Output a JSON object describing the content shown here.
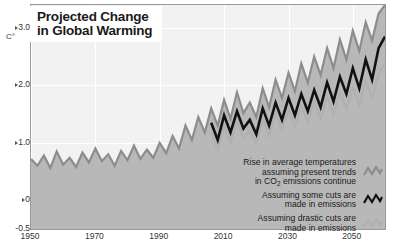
{
  "title": {
    "line1": "Projected Change",
    "line2": "in Global Warming"
  },
  "axes": {
    "y_unit": "C°",
    "y_ticks": [
      "3.0",
      "2.0",
      "1.0",
      "0",
      "-0.5"
    ],
    "y_tick_values": [
      3.0,
      2.0,
      1.0,
      0,
      -0.5
    ],
    "x_ticks": [
      "1950",
      "1970",
      "1990",
      "2010",
      "2030",
      "2050"
    ],
    "x_tick_values": [
      1950,
      1970,
      1990,
      2010,
      2030,
      2050
    ]
  },
  "legend": {
    "items": [
      {
        "line1": "Rise in average temperatures",
        "line2": "assuming present trends",
        "line3_pre": "in CO",
        "line3_sub": "2",
        "line3_post": " emissions continue",
        "glyph": "zigzag-line-icon",
        "color": "#8c8c8c"
      },
      {
        "line1": "Assuming some cuts are",
        "line2": "made in emissions",
        "glyph": "zigzag-line-icon",
        "color": "#111111"
      },
      {
        "line1": "Assuming drastic cuts are",
        "line2": "made in emissions",
        "glyph": "zigzag-line-icon",
        "color": "#b0b0b0"
      }
    ]
  },
  "colors": {
    "plot_background": "#f2f2f2",
    "area_fill": "#b8b8b8",
    "grid": "#ffffff",
    "border": "#9a9a9a",
    "high_scenario": "#8c8c8c",
    "mid_scenario": "#111111",
    "low_scenario": "#b0b0b0",
    "text": "#1a1a1a"
  },
  "chart_data": {
    "type": "line",
    "title": "Projected Change in Global Warming",
    "xlabel": "",
    "ylabel": "C°",
    "xlim": [
      1950,
      2060
    ],
    "ylim": [
      -0.5,
      3.4
    ],
    "grid": true,
    "legend_position": "bottom-right",
    "area_fill_series": "high_scenario",
    "x": [
      1950,
      1952,
      1954,
      1956,
      1958,
      1960,
      1962,
      1964,
      1966,
      1968,
      1970,
      1972,
      1974,
      1976,
      1978,
      1980,
      1982,
      1984,
      1986,
      1988,
      1990,
      1992,
      1994,
      1996,
      1998,
      2000,
      2002,
      2004,
      2006,
      2008,
      2010,
      2012,
      2014,
      2016,
      2018,
      2020,
      2022,
      2024,
      2026,
      2028,
      2030,
      2032,
      2034,
      2036,
      2038,
      2040,
      2042,
      2044,
      2046,
      2048,
      2050,
      2052,
      2054,
      2056,
      2058,
      2060
    ],
    "series": [
      {
        "name": "Rise in average temperatures assuming present trends in CO2 emissions continue",
        "color": "#8c8c8c",
        "values": [
          0.72,
          0.6,
          0.78,
          0.56,
          0.85,
          0.62,
          0.74,
          0.58,
          0.83,
          0.66,
          0.9,
          0.68,
          0.8,
          0.6,
          0.86,
          0.7,
          0.95,
          0.72,
          0.88,
          0.74,
          1.0,
          0.82,
          1.12,
          0.9,
          1.3,
          1.05,
          1.45,
          1.18,
          1.6,
          1.3,
          1.75,
          1.42,
          1.88,
          1.52,
          1.7,
          1.45,
          1.95,
          1.62,
          2.1,
          1.78,
          2.22,
          1.9,
          2.38,
          2.05,
          2.5,
          2.18,
          2.65,
          2.3,
          2.8,
          2.45,
          2.95,
          2.6,
          3.1,
          2.78,
          3.25,
          3.4
        ]
      },
      {
        "name": "Assuming some cuts are made in emissions",
        "color": "#111111",
        "values": [
          null,
          null,
          null,
          null,
          null,
          null,
          null,
          null,
          null,
          null,
          null,
          null,
          null,
          null,
          null,
          null,
          null,
          null,
          null,
          null,
          null,
          null,
          null,
          null,
          null,
          null,
          null,
          null,
          1.35,
          1.05,
          1.48,
          1.18,
          1.55,
          1.25,
          1.4,
          1.15,
          1.6,
          1.3,
          1.7,
          1.4,
          1.78,
          1.48,
          1.85,
          1.55,
          1.92,
          1.62,
          2.05,
          1.72,
          2.15,
          1.85,
          2.3,
          1.95,
          2.45,
          2.1,
          2.65,
          2.85
        ]
      },
      {
        "name": "Assuming drastic cuts are made in emissions",
        "color": "#b0b0b0",
        "values": [
          null,
          null,
          null,
          null,
          null,
          null,
          null,
          null,
          null,
          null,
          null,
          null,
          null,
          null,
          null,
          null,
          null,
          null,
          null,
          null,
          null,
          null,
          null,
          null,
          null,
          null,
          null,
          null,
          1.18,
          0.88,
          1.3,
          1.0,
          1.38,
          1.08,
          1.22,
          0.98,
          1.42,
          1.12,
          1.52,
          1.22,
          1.58,
          1.28,
          1.65,
          1.35,
          1.72,
          1.42,
          1.8,
          1.5,
          1.88,
          1.58,
          1.98,
          1.66,
          2.08,
          1.78,
          2.2,
          2.4
        ]
      }
    ]
  }
}
